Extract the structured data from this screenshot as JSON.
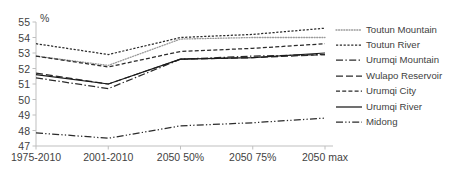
{
  "axis": {
    "unit_label": "%",
    "y_ticks": [
      "47",
      "48",
      "49",
      "50",
      "51",
      "52",
      "53",
      "54",
      "55"
    ],
    "x_ticks": [
      "1975-2010",
      "2001-2010",
      "2050 50%",
      "2050 75%",
      "2050 max"
    ]
  },
  "legend": {
    "items": [
      {
        "label": "Toutun Mountain",
        "style": "dotted",
        "color": "#9a9a9a"
      },
      {
        "label": "Toutun River",
        "style": "fine-dash",
        "color": "#2b2b2b"
      },
      {
        "label": "Urumqi Mountain",
        "style": "dash-dot",
        "color": "#2b2b2b"
      },
      {
        "label": "Wulapo Reservoir",
        "style": "long-dash",
        "color": "#2b2b2b"
      },
      {
        "label": "Urumqi City",
        "style": "medium-dash",
        "color": "#2b2b2b"
      },
      {
        "label": "Urumqi River",
        "style": "solid",
        "color": "#1a1a1a"
      },
      {
        "label": "Midong",
        "style": "dash-dot-dot",
        "color": "#2b2b2b"
      }
    ]
  },
  "chart_data": {
    "type": "line",
    "title": "",
    "subtitle": "",
    "xlabel": "",
    "ylabel": "%",
    "ylim": [
      47,
      55
    ],
    "ytick_step": 1,
    "grid": false,
    "legend_position": "right",
    "categories": [
      "1975-2010",
      "2001-2010",
      "2050 50%",
      "2050 75%",
      "2050 max"
    ],
    "series": [
      {
        "name": "Toutun Mountain",
        "style": "dotted",
        "color": "#9a9a9a",
        "values": [
          52.8,
          52.2,
          53.9,
          54.0,
          54.0
        ]
      },
      {
        "name": "Toutun River",
        "style": "fine-dash",
        "color": "#2b2b2b",
        "values": [
          53.6,
          52.9,
          54.0,
          54.2,
          54.6
        ]
      },
      {
        "name": "Urumqi Mountain",
        "style": "dash-dot",
        "color": "#2b2b2b",
        "values": [
          51.4,
          50.7,
          52.6,
          52.8,
          52.9
        ]
      },
      {
        "name": "Wulapo Reservoir",
        "style": "long-dash",
        "color": "#2b2b2b",
        "values": [
          51.7,
          51.0,
          52.6,
          52.7,
          52.9
        ]
      },
      {
        "name": "Urumqi City",
        "style": "medium-dash",
        "color": "#2b2b2b",
        "values": [
          52.8,
          52.1,
          53.1,
          53.3,
          53.6
        ]
      },
      {
        "name": "Urumqi River",
        "style": "solid",
        "color": "#1a1a1a",
        "values": [
          51.6,
          51.0,
          52.6,
          52.7,
          53.0
        ]
      },
      {
        "name": "Midong",
        "style": "dash-dot-dot",
        "color": "#2b2b2b",
        "values": [
          47.85,
          47.5,
          48.3,
          48.5,
          48.8
        ]
      }
    ]
  }
}
